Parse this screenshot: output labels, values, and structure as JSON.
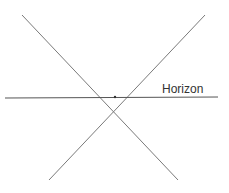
{
  "diagram": {
    "label": "Horizon",
    "colors": {
      "line": "#6e6e6e",
      "horizon": "#555555",
      "text": "#333333"
    }
  }
}
